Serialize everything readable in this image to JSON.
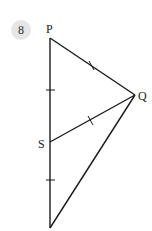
{
  "question": {
    "number": "8"
  },
  "figure": {
    "labels": {
      "P": "P",
      "Q": "Q",
      "S": "S"
    },
    "points": {
      "P": [
        50,
        38
      ],
      "Q": [
        135,
        95
      ],
      "S": [
        50,
        142
      ],
      "R": [
        50,
        228
      ]
    },
    "stroke_color": "#1a1a1a"
  }
}
